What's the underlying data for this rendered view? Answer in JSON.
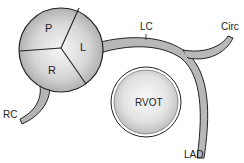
{
  "diagram": {
    "type": "anatomical schematic",
    "aortic_root": {
      "cusps": {
        "posterior": "P",
        "left": "L",
        "right": "R"
      }
    },
    "vessels": {
      "left_coronary": "LC",
      "circumflex": "Circ",
      "left_anterior_descending": "LAD",
      "right_coronary": "RC"
    },
    "rvot": "RVOT"
  },
  "colors": {
    "stroke": "#222222",
    "vessel_fill": "#b8b8b8",
    "sphere_light": "#f4f4f4",
    "sphere_dark": "#a8a8a8",
    "background": "#ffffff"
  }
}
